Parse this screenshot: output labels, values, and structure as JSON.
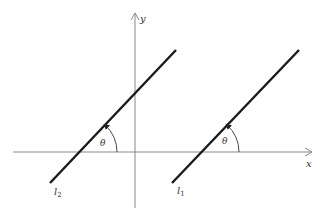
{
  "diagram": {
    "axes": {
      "x_label": "x",
      "y_label": "y",
      "axis_color": "#888888"
    },
    "lines": [
      {
        "name": "l2",
        "label_main": "l",
        "label_sub": "2",
        "color": "#1a1a1a"
      },
      {
        "name": "l1",
        "label_main": "l",
        "label_sub": "1",
        "color": "#1a1a1a"
      }
    ],
    "angles": [
      {
        "at": "l2",
        "label": "θ"
      },
      {
        "at": "l1",
        "label": "θ"
      }
    ]
  }
}
